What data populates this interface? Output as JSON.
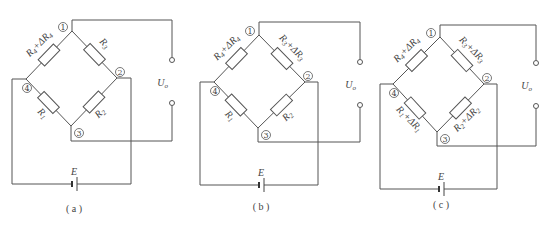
{
  "figure": {
    "line_color": "#555555",
    "text_color": "#444444",
    "node_labels": [
      "①",
      "②",
      "③",
      "④"
    ],
    "output_label": "U",
    "output_sub": "o",
    "source_label": "E",
    "panels": [
      {
        "id": "a",
        "caption": "( a )",
        "resistors": {
          "r4": {
            "main": "R",
            "sub": "4",
            "delta": "+ΔR",
            "delta_sub": "4"
          },
          "r3": {
            "main": "R",
            "sub": "3",
            "delta": "",
            "delta_sub": ""
          },
          "r1": {
            "main": "R",
            "sub": "1",
            "delta": "",
            "delta_sub": ""
          },
          "r2": {
            "main": "R",
            "sub": "2",
            "delta": "",
            "delta_sub": ""
          }
        }
      },
      {
        "id": "b",
        "caption": "( b )",
        "resistors": {
          "r4": {
            "main": "R",
            "sub": "4",
            "delta": "+ΔR",
            "delta_sub": "4"
          },
          "r3": {
            "main": "R",
            "sub": "3",
            "delta": "+ΔR",
            "delta_sub": "3"
          },
          "r1": {
            "main": "R",
            "sub": "1",
            "delta": "",
            "delta_sub": ""
          },
          "r2": {
            "main": "R",
            "sub": "2",
            "delta": "",
            "delta_sub": ""
          }
        }
      },
      {
        "id": "c",
        "caption": "( c )",
        "resistors": {
          "r4": {
            "main": "R",
            "sub": "4",
            "delta": "+ΔR",
            "delta_sub": "4"
          },
          "r3": {
            "main": "R",
            "sub": "3",
            "delta": "+ΔR",
            "delta_sub": "3"
          },
          "r1": {
            "main": "R",
            "sub": "1",
            "delta": "+ΔR",
            "delta_sub": "1"
          },
          "r2": {
            "main": "R",
            "sub": "2",
            "delta": "+ΔR",
            "delta_sub": "2"
          }
        }
      }
    ]
  }
}
